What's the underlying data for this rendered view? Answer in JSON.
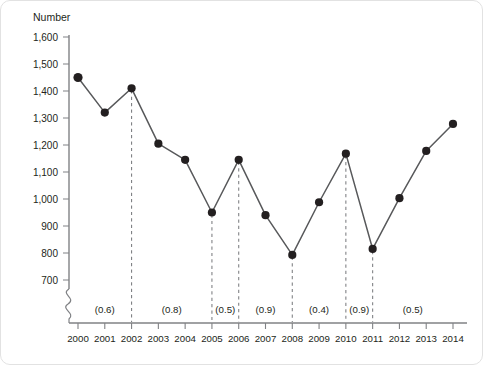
{
  "chart_data": {
    "type": "line",
    "title": "",
    "subtitle": "",
    "xlabel": "",
    "ylabel": "Number",
    "ylim": [
      700,
      1600
    ],
    "ytick_labels": [
      "700",
      "800",
      "900",
      "1,000",
      "1,100",
      "1,200",
      "1,300",
      "1,400",
      "1,500",
      "1,600"
    ],
    "ytick_values": [
      700,
      800,
      900,
      1000,
      1100,
      1200,
      1300,
      1400,
      1500,
      1600
    ],
    "y_axis_break": true,
    "grid": false,
    "legend": "none",
    "categories": [
      "2000",
      "2001",
      "2002",
      "2003",
      "2004",
      "2005",
      "2006",
      "2007",
      "2008",
      "2009",
      "2010",
      "2011",
      "2012",
      "2013",
      "2014"
    ],
    "x": [
      2000,
      2001,
      2002,
      2003,
      2004,
      2005,
      2006,
      2007,
      2008,
      2009,
      2010,
      2011,
      2012,
      2013,
      2014
    ],
    "values": [
      1450,
      1320,
      1410,
      1205,
      1145,
      950,
      1145,
      940,
      793,
      988,
      1168,
      815,
      1003,
      1178,
      1278
    ],
    "marker": "filled-circle",
    "drop_line_years": [
      2002,
      2005,
      2006,
      2008,
      2010,
      2011
    ],
    "annotations": [
      {
        "label": "(0.6)",
        "value": 0.6,
        "start_year": 2000,
        "end_year": 2002
      },
      {
        "label": "(0.8)",
        "value": 0.8,
        "start_year": 2002,
        "end_year": 2005
      },
      {
        "label": "(0.5)",
        "value": 0.5,
        "start_year": 2005,
        "end_year": 2006
      },
      {
        "label": "(0.9)",
        "value": 0.9,
        "start_year": 2006,
        "end_year": 2008
      },
      {
        "label": "(0.4)",
        "value": 0.4,
        "start_year": 2008,
        "end_year": 2010
      },
      {
        "label": "(0.9)",
        "value": 0.9,
        "start_year": 2010,
        "end_year": 2011
      },
      {
        "label": "(0.5)",
        "value": 0.5,
        "start_year": 2011,
        "end_year": 2014
      }
    ],
    "colors": {
      "line": "#58595b",
      "marker": "#231f20",
      "axis": "#808285",
      "text": "#231f20",
      "background": "#ffffff",
      "card_border": "#e2e2e2"
    }
  }
}
